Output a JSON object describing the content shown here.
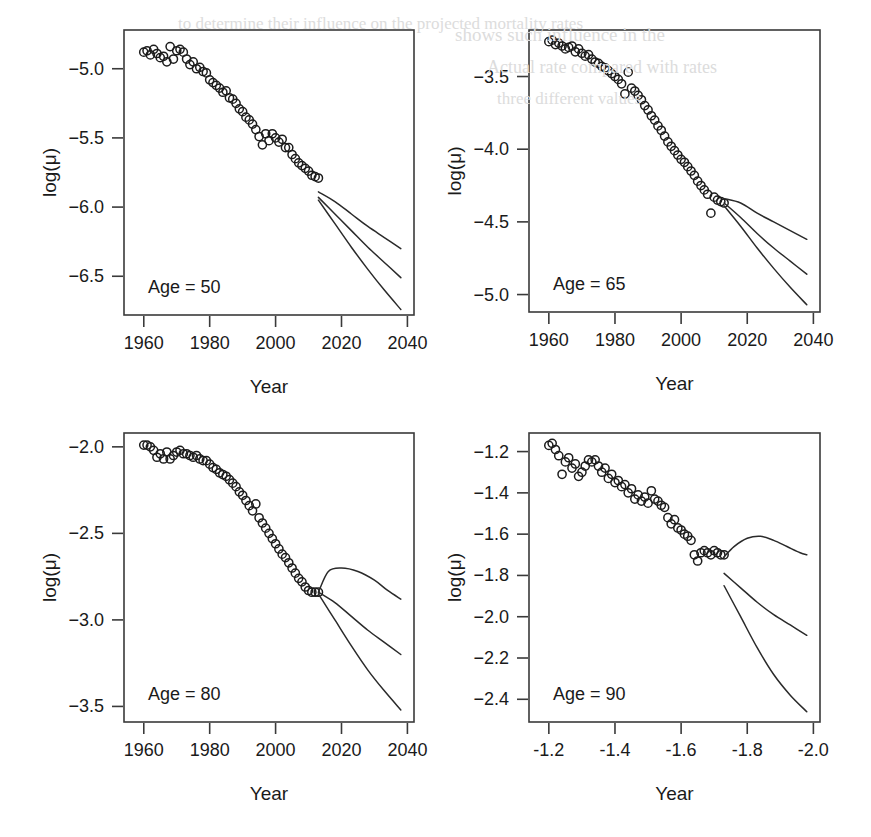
{
  "figure": {
    "background_color": "#ffffff",
    "ink_color": "#2a2a2a",
    "panel_count": 4,
    "ghost_text": [
      {
        "text": "to determine their influence on the projected mortality rates",
        "x": 178,
        "y": 14,
        "size": 17
      },
      {
        "text": "shows such influence in the",
        "x": 455,
        "y": 24,
        "size": 19
      },
      {
        "text": "Actual rate compared with rates",
        "x": 487,
        "y": 57,
        "size": 18
      },
      {
        "text": "three different values",
        "x": 497,
        "y": 89,
        "size": 17
      }
    ]
  },
  "chart_data": [
    {
      "id": "panel-age-50",
      "type": "scatter",
      "title": "Age = 50",
      "xlabel": "Year",
      "ylabel": "log(μ)",
      "xlim": [
        1954,
        2042
      ],
      "ylim": [
        -6.78,
        -4.72
      ],
      "xticks": [
        1960,
        1980,
        2000,
        2020,
        2040
      ],
      "yticks": [
        -5.0,
        -5.5,
        -6.0,
        -6.5
      ],
      "xticklabels": [
        "1960",
        "1980",
        "2000",
        "2020",
        "2040"
      ],
      "yticklabels": [
        "-5.0",
        "-5.5",
        "-6.0",
        "-6.5"
      ],
      "grid": false,
      "legend": "none",
      "observed": {
        "name": "Observed log mortality",
        "marker": "open-circle",
        "x": [
          1960,
          1961,
          1962,
          1963,
          1964,
          1965,
          1966,
          1967,
          1968,
          1969,
          1970,
          1971,
          1972,
          1973,
          1974,
          1975,
          1976,
          1977,
          1978,
          1979,
          1980,
          1981,
          1982,
          1983,
          1984,
          1985,
          1986,
          1987,
          1988,
          1989,
          1990,
          1991,
          1992,
          1993,
          1994,
          1995,
          1996,
          1997,
          1998,
          1999,
          2000,
          2001,
          2002,
          2003,
          2004,
          2005,
          2006,
          2007,
          2008,
          2009,
          2010,
          2011,
          2012,
          2013
        ],
        "y": [
          -4.88,
          -4.87,
          -4.9,
          -4.86,
          -4.89,
          -4.92,
          -4.91,
          -4.95,
          -4.84,
          -4.93,
          -4.87,
          -4.86,
          -4.88,
          -4.93,
          -4.97,
          -4.95,
          -5.0,
          -4.99,
          -5.02,
          -5.03,
          -5.08,
          -5.1,
          -5.12,
          -5.14,
          -5.17,
          -5.16,
          -5.21,
          -5.22,
          -5.25,
          -5.29,
          -5.31,
          -5.35,
          -5.37,
          -5.4,
          -5.44,
          -5.49,
          -5.55,
          -5.47,
          -5.52,
          -5.47,
          -5.5,
          -5.53,
          -5.51,
          -5.57,
          -5.57,
          -5.62,
          -5.65,
          -5.68,
          -5.7,
          -5.72,
          -5.74,
          -5.77,
          -5.78,
          -5.79
        ]
      },
      "forecasts": [
        {
          "name": "upper-variant",
          "x": [
            2013,
            2018,
            2023,
            2028,
            2033,
            2038
          ],
          "y": [
            -5.89,
            -5.96,
            -6.05,
            -6.14,
            -6.22,
            -6.3
          ]
        },
        {
          "name": "central-variant",
          "x": [
            2013,
            2018,
            2023,
            2028,
            2033,
            2038
          ],
          "y": [
            -5.93,
            -6.05,
            -6.17,
            -6.29,
            -6.4,
            -6.51
          ]
        },
        {
          "name": "lower-variant",
          "x": [
            2013,
            2018,
            2023,
            2028,
            2033,
            2038
          ],
          "y": [
            -5.95,
            -6.12,
            -6.29,
            -6.45,
            -6.6,
            -6.74
          ]
        }
      ]
    },
    {
      "id": "panel-age-65",
      "type": "scatter",
      "title": "Age = 65",
      "xlabel": "Year",
      "ylabel": "log(μ)",
      "xlim": [
        1954,
        2042
      ],
      "ylim": [
        -5.12,
        -3.18
      ],
      "xticks": [
        1960,
        1980,
        2000,
        2020,
        2040
      ],
      "yticks": [
        -3.5,
        -4.0,
        -4.5,
        -5.0
      ],
      "xticklabels": [
        "1960",
        "1980",
        "2000",
        "2020",
        "2040"
      ],
      "yticklabels": [
        "-3.5",
        "-4.0",
        "-4.5",
        "-5.0"
      ],
      "grid": false,
      "legend": "none",
      "observed": {
        "name": "Observed log mortality",
        "marker": "open-circle",
        "x": [
          1960,
          1961,
          1962,
          1963,
          1964,
          1965,
          1966,
          1967,
          1968,
          1969,
          1970,
          1971,
          1972,
          1973,
          1974,
          1975,
          1976,
          1977,
          1978,
          1979,
          1980,
          1981,
          1982,
          1983,
          1984,
          1985,
          1986,
          1987,
          1988,
          1989,
          1990,
          1991,
          1992,
          1993,
          1994,
          1995,
          1996,
          1997,
          1998,
          1999,
          2000,
          2001,
          2002,
          2003,
          2004,
          2005,
          2006,
          2007,
          2008,
          2009,
          2010,
          2011,
          2012,
          2013
        ],
        "y": [
          -3.26,
          -3.25,
          -3.28,
          -3.27,
          -3.29,
          -3.31,
          -3.3,
          -3.29,
          -3.33,
          -3.31,
          -3.34,
          -3.36,
          -3.35,
          -3.38,
          -3.4,
          -3.41,
          -3.43,
          -3.44,
          -3.46,
          -3.48,
          -3.5,
          -3.52,
          -3.55,
          -3.62,
          -3.47,
          -3.58,
          -3.6,
          -3.63,
          -3.66,
          -3.7,
          -3.73,
          -3.77,
          -3.8,
          -3.84,
          -3.87,
          -3.91,
          -3.95,
          -3.98,
          -4.01,
          -4.04,
          -4.07,
          -4.09,
          -4.12,
          -4.15,
          -4.18,
          -4.22,
          -4.25,
          -4.28,
          -4.31,
          -4.44,
          -4.33,
          -4.35,
          -4.36,
          -4.37
        ]
      },
      "forecasts": [
        {
          "name": "upper-variant",
          "x": [
            2013,
            2018,
            2023,
            2028,
            2033,
            2038
          ],
          "y": [
            -4.34,
            -4.37,
            -4.44,
            -4.5,
            -4.56,
            -4.62
          ]
        },
        {
          "name": "central-variant",
          "x": [
            2013,
            2018,
            2023,
            2028,
            2033,
            2038
          ],
          "y": [
            -4.37,
            -4.47,
            -4.58,
            -4.68,
            -4.77,
            -4.86
          ]
        },
        {
          "name": "lower-variant",
          "x": [
            2013,
            2018,
            2023,
            2028,
            2033,
            2038
          ],
          "y": [
            -4.39,
            -4.53,
            -4.68,
            -4.82,
            -4.95,
            -5.07
          ]
        }
      ]
    },
    {
      "id": "panel-age-80",
      "type": "scatter",
      "title": "Age = 80",
      "xlabel": "Year",
      "ylabel": "log(μ)",
      "xlim": [
        1954,
        2042
      ],
      "ylim": [
        -3.59,
        -1.92
      ],
      "xticks": [
        1960,
        1980,
        2000,
        2020,
        2040
      ],
      "yticks": [
        -2.0,
        -2.5,
        -3.0,
        -3.5
      ],
      "xticklabels": [
        "1960",
        "1980",
        "2000",
        "2020",
        "2040"
      ],
      "yticklabels": [
        "-2.0",
        "-2.5",
        "-3.0",
        "-3.5"
      ],
      "grid": false,
      "legend": "none",
      "observed": {
        "name": "Observed log mortality",
        "marker": "open-circle",
        "x": [
          1960,
          1961,
          1962,
          1963,
          1964,
          1965,
          1966,
          1967,
          1968,
          1969,
          1970,
          1971,
          1972,
          1973,
          1974,
          1975,
          1976,
          1977,
          1978,
          1979,
          1980,
          1981,
          1982,
          1983,
          1984,
          1985,
          1986,
          1987,
          1988,
          1989,
          1990,
          1991,
          1992,
          1993,
          1994,
          1995,
          1996,
          1997,
          1998,
          1999,
          2000,
          2001,
          2002,
          2003,
          2004,
          2005,
          2006,
          2007,
          2008,
          2009,
          2010,
          2011,
          2012,
          2013
        ],
        "y": [
          -1.99,
          -1.99,
          -2.0,
          -2.02,
          -2.06,
          -2.04,
          -2.07,
          -2.03,
          -2.07,
          -2.05,
          -2.03,
          -2.02,
          -2.04,
          -2.04,
          -2.05,
          -2.06,
          -2.05,
          -2.07,
          -2.08,
          -2.08,
          -2.1,
          -2.12,
          -2.13,
          -2.15,
          -2.16,
          -2.17,
          -2.19,
          -2.21,
          -2.23,
          -2.26,
          -2.28,
          -2.31,
          -2.34,
          -2.37,
          -2.33,
          -2.41,
          -2.44,
          -2.47,
          -2.5,
          -2.53,
          -2.56,
          -2.59,
          -2.62,
          -2.64,
          -2.67,
          -2.7,
          -2.73,
          -2.76,
          -2.78,
          -2.81,
          -2.83,
          -2.84,
          -2.84,
          -2.84
        ]
      },
      "forecasts": [
        {
          "name": "upper-variant",
          "x": [
            2013,
            2016,
            2020,
            2025,
            2030,
            2034,
            2038
          ],
          "y": [
            -2.84,
            -2.72,
            -2.7,
            -2.72,
            -2.77,
            -2.83,
            -2.88
          ]
        },
        {
          "name": "central-variant",
          "x": [
            2013,
            2018,
            2023,
            2028,
            2033,
            2038
          ],
          "y": [
            -2.84,
            -2.9,
            -2.98,
            -3.06,
            -3.13,
            -3.2
          ]
        },
        {
          "name": "lower-variant",
          "x": [
            2013,
            2018,
            2023,
            2028,
            2033,
            2038
          ],
          "y": [
            -2.85,
            -3.0,
            -3.15,
            -3.29,
            -3.41,
            -3.52
          ]
        }
      ]
    },
    {
      "id": "panel-age-90",
      "type": "scatter",
      "title": "Age = 90",
      "xlabel": "Year",
      "ylabel": "log(μ)",
      "xlim": [
        1954,
        2042
      ],
      "ylim": [
        -2.51,
        -1.11
      ],
      "xticks": [
        1960,
        1980,
        2000,
        2020,
        2040
      ],
      "yticks": [
        -1.2,
        -1.4,
        -1.6,
        -1.8,
        -2.0,
        -2.2,
        -2.4
      ],
      "xticklabels": [
        "-1.2",
        "-1.4",
        "-1.6",
        "-1.8",
        "-2.0",
        "-2.2",
        "-2.4"
      ],
      "yticklabels": [
        "-1.2",
        "-1.4",
        "-1.6",
        "-1.8",
        "-2.0",
        "-2.2",
        "-2.4"
      ],
      "grid": false,
      "legend": "none",
      "observed": {
        "name": "Observed log mortality",
        "marker": "open-circle",
        "x": [
          1960,
          1961,
          1962,
          1963,
          1964,
          1965,
          1966,
          1967,
          1968,
          1969,
          1970,
          1971,
          1972,
          1973,
          1974,
          1975,
          1976,
          1977,
          1978,
          1979,
          1980,
          1981,
          1982,
          1983,
          1984,
          1985,
          1986,
          1987,
          1988,
          1989,
          1990,
          1991,
          1992,
          1993,
          1994,
          1995,
          1996,
          1997,
          1998,
          1999,
          2000,
          2001,
          2002,
          2003,
          2004,
          2005,
          2006,
          2007,
          2008,
          2009,
          2010,
          2011,
          2012,
          2013
        ],
        "y": [
          -1.17,
          -1.16,
          -1.19,
          -1.22,
          -1.31,
          -1.25,
          -1.23,
          -1.28,
          -1.26,
          -1.32,
          -1.3,
          -1.27,
          -1.24,
          -1.25,
          -1.24,
          -1.27,
          -1.3,
          -1.28,
          -1.33,
          -1.31,
          -1.35,
          -1.34,
          -1.37,
          -1.36,
          -1.4,
          -1.38,
          -1.43,
          -1.41,
          -1.44,
          -1.42,
          -1.45,
          -1.39,
          -1.43,
          -1.44,
          -1.46,
          -1.47,
          -1.52,
          -1.55,
          -1.53,
          -1.57,
          -1.58,
          -1.6,
          -1.61,
          -1.63,
          -1.7,
          -1.73,
          -1.69,
          -1.68,
          -1.69,
          -1.7,
          -1.68,
          -1.69,
          -1.7,
          -1.7
        ]
      },
      "forecasts": [
        {
          "name": "upper-variant",
          "x": [
            2013,
            2016,
            2020,
            2024,
            2028,
            2032,
            2036,
            2038
          ],
          "y": [
            -1.71,
            -1.66,
            -1.62,
            -1.61,
            -1.63,
            -1.66,
            -1.69,
            -1.7
          ]
        },
        {
          "name": "central-variant",
          "x": [
            2013,
            2018,
            2023,
            2028,
            2033,
            2038
          ],
          "y": [
            -1.79,
            -1.86,
            -1.93,
            -1.99,
            -2.04,
            -2.09
          ]
        },
        {
          "name": "lower-variant",
          "x": [
            2013,
            2018,
            2023,
            2028,
            2033,
            2038
          ],
          "y": [
            -1.85,
            -2.0,
            -2.15,
            -2.28,
            -2.38,
            -2.46
          ]
        }
      ]
    }
  ]
}
